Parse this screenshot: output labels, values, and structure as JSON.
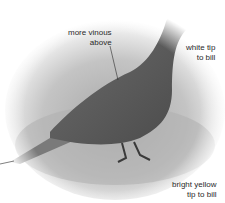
{
  "figure": {
    "colors": {
      "background": "#ffffff",
      "bird_body": "#5a5a5a",
      "ground": "#b8b8b8",
      "text": "#2a2a2a"
    },
    "annotations": [
      {
        "id": "upperparts",
        "lines": [
          "more vinous",
          "above"
        ]
      },
      {
        "id": "bill-tip",
        "lines": [
          "white tip",
          "to bill"
        ]
      },
      {
        "id": "bill-yellow",
        "lines": [
          "bright yellow",
          "tip to bill"
        ]
      }
    ]
  }
}
